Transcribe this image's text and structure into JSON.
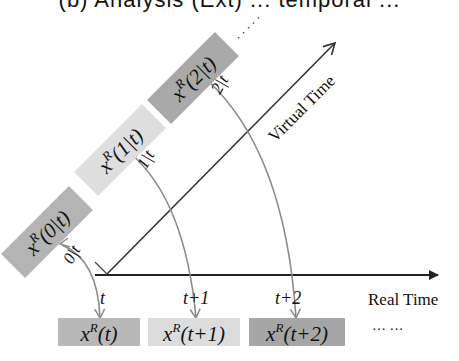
{
  "title": "(b) Analysis (Ext) ... temporal ... ",
  "axes": {
    "real_time_label": "Real Time",
    "virtual_time_label": "Virtual Time"
  },
  "real_time_ticks": [
    {
      "label": "t"
    },
    {
      "label": "t+1"
    },
    {
      "label": "t+2"
    }
  ],
  "virtual_boxes": [
    {
      "base": "x",
      "sup": "R",
      "arg": "(0|t)",
      "edge_label": "0|t",
      "color": "#b4b4b4"
    },
    {
      "base": "x",
      "sup": "R",
      "arg": "(1|t)",
      "edge_label": "1|t",
      "color": "#dedede"
    },
    {
      "base": "x",
      "sup": "R",
      "arg": "(2|t)",
      "edge_label": "2|t",
      "color": "#a9a9a9"
    }
  ],
  "real_boxes": [
    {
      "base": "x",
      "sup": "R",
      "arg": "(t)",
      "color": "#b8b8b8"
    },
    {
      "base": "x",
      "sup": "R",
      "arg": "(t+1)",
      "color": "#dcdcdc"
    },
    {
      "base": "x",
      "sup": "R",
      "arg": "(t+2)",
      "color": "#a6a6a6"
    }
  ],
  "ellipsis_virtual": "· · · · ·",
  "ellipsis_real": "··· ···",
  "colors": {
    "axis": "#222222",
    "curve": "#8a8a8a"
  }
}
